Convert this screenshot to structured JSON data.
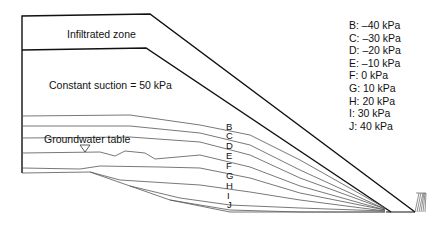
{
  "diagram": {
    "zones": {
      "infiltrated": "Infiltrated zone",
      "suction": "Constant suction = 50 kPa"
    },
    "groundwater_label": "Groundwater table",
    "curve_letters": [
      "B",
      "C",
      "D",
      "E",
      "F",
      "G",
      "H",
      "I",
      "J"
    ],
    "legend": [
      "B: –40 kPa",
      "C: –30 kPa",
      "D: –20 kPa",
      "E: –10 kPa",
      "F: 0 kPa",
      "G: 10 kPa",
      "H: 20 kPa",
      "I: 30 kPa",
      "J: 40 kPa"
    ]
  }
}
